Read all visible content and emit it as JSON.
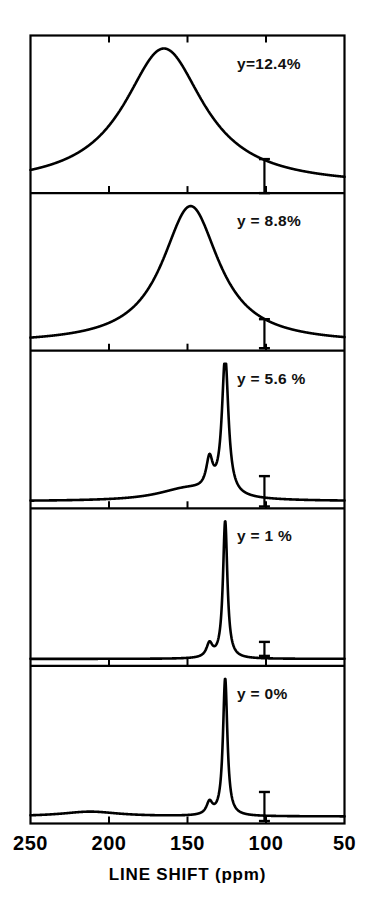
{
  "page": {
    "running_head": "HEAVILY DOPED POLYMERS"
  },
  "chart_data": {
    "type": "line",
    "title": "",
    "subtitle": "",
    "xlabel": "LINE SHIFT (ppm)",
    "ylabel": "",
    "xlim": [
      250,
      50
    ],
    "axis_reversed": true,
    "grid": false,
    "legend_position": "in-panel-right",
    "xticks": [
      250,
      200,
      150,
      100,
      50
    ],
    "xtick_labels": [
      "250",
      "200",
      "150",
      "100",
      "50"
    ],
    "tick_labels_shown": [
      "200",
      "150",
      "100"
    ],
    "units": "ppm",
    "panel_count": 5,
    "stacked": true,
    "panels": [
      {
        "id": "panel-1",
        "annotation": "y=12.4%",
        "y_value": 12.4,
        "description": "single very broad resonance",
        "peaks": [
          {
            "center_ppm": 165,
            "relative_height": 1.0,
            "fwhm_ppm": 62,
            "label": "broad-line"
          }
        ],
        "baseline_left_ppm": 250,
        "baseline_right_ppm": 50,
        "error_bar": {
          "center_ppm": 101,
          "half_width_ppm": 0,
          "visible": true
        }
      },
      {
        "id": "panel-2",
        "annotation": "y = 8.8%",
        "y_value": 8.8,
        "description": "broad resonance, narrower and shifted downfield of panel 1",
        "peaks": [
          {
            "center_ppm": 148,
            "relative_height": 1.0,
            "fwhm_ppm": 44,
            "label": "broad-line"
          }
        ],
        "baseline_left_ppm": 250,
        "baseline_right_ppm": 50,
        "error_bar": {
          "center_ppm": 101,
          "half_width_ppm": 0,
          "visible": true
        }
      },
      {
        "id": "panel-3",
        "annotation": "y = 5.6 %",
        "y_value": 5.6,
        "description": "sharp main line with resolved shoulder and broad pedestal",
        "peaks": [
          {
            "center_ppm": 126,
            "relative_height": 1.0,
            "fwhm_ppm": 5,
            "label": "main-line"
          },
          {
            "center_ppm": 136,
            "relative_height": 0.22,
            "fwhm_ppm": 5,
            "label": "shoulder-line"
          },
          {
            "center_ppm": 150,
            "relative_height": 0.09,
            "fwhm_ppm": 46,
            "label": "broad-pedestal"
          }
        ],
        "baseline_left_ppm": 250,
        "baseline_right_ppm": 50,
        "error_bar": {
          "center_ppm": 101,
          "half_width_ppm": 0,
          "visible": true
        }
      },
      {
        "id": "panel-4",
        "annotation": "y = 1 %",
        "y_value": 1,
        "description": "very sharp main line with small shoulder, flat baseline",
        "peaks": [
          {
            "center_ppm": 126,
            "relative_height": 1.0,
            "fwhm_ppm": 3.4,
            "label": "main-line"
          },
          {
            "center_ppm": 136,
            "relative_height": 0.1,
            "fwhm_ppm": 4.6,
            "label": "shoulder-line"
          }
        ],
        "baseline_left_ppm": 250,
        "baseline_right_ppm": 50,
        "error_bar": {
          "center_ppm": 101,
          "half_width_ppm": 0,
          "visible": true
        }
      },
      {
        "id": "panel-5",
        "annotation": "y = 0%",
        "y_value": 0,
        "description": "very sharp main line with small shoulder and a weak broad hump near 210 ppm",
        "peaks": [
          {
            "center_ppm": 126,
            "relative_height": 1.0,
            "fwhm_ppm": 3.4,
            "label": "main-line"
          },
          {
            "center_ppm": 136,
            "relative_height": 0.09,
            "fwhm_ppm": 4.6,
            "label": "shoulder-line"
          },
          {
            "center_ppm": 212,
            "relative_height": 0.035,
            "fwhm_ppm": 44,
            "label": "weak-broad-hump"
          }
        ],
        "baseline_left_ppm": 250,
        "baseline_right_ppm": 50,
        "error_bar": {
          "center_ppm": 101,
          "half_width_ppm": 0,
          "visible": true
        }
      }
    ]
  },
  "colors": {
    "ink": "#000000",
    "paper": "#ffffff"
  }
}
